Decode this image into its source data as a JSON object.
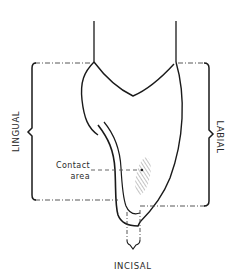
{
  "figure": {
    "type": "dental cross-section diagram",
    "labels": {
      "left": "LINGUAL",
      "right": "LABIAL",
      "bottom": "INCISAL",
      "contact_line1": "Contact",
      "contact_line2": "area"
    },
    "colors": {
      "stroke": "#1a1a1a",
      "dash": "#444444",
      "hatch": "#8a8a8a",
      "background": "#ffffff"
    }
  }
}
